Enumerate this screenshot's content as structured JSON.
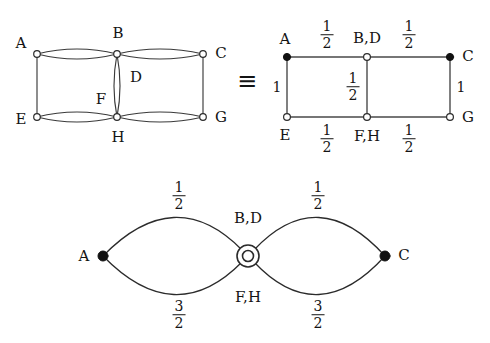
{
  "figure": {
    "equivalence_symbol": "≡",
    "background_color": "#ffffff",
    "stroke_color": "#3a3a3a",
    "text_color": "#141414"
  },
  "graph_left": {
    "name": "cube-like-multigraph",
    "vertices": [
      {
        "id": "A",
        "label": "A",
        "x": 37,
        "y": 54,
        "fill": "open"
      },
      {
        "id": "B",
        "label": "B",
        "x": 117,
        "y": 54,
        "fill": "open"
      },
      {
        "id": "C",
        "label": "C",
        "x": 203,
        "y": 54,
        "fill": "open"
      },
      {
        "id": "E",
        "label": "E",
        "x": 37,
        "y": 117,
        "fill": "open"
      },
      {
        "id": "H",
        "label": "H",
        "x": 117,
        "y": 117,
        "fill": "open"
      },
      {
        "id": "G",
        "label": "G",
        "x": 203,
        "y": 117,
        "fill": "open"
      }
    ],
    "interior_labels": [
      {
        "id": "D",
        "label": "D",
        "x": 136,
        "y": 77
      },
      {
        "id": "F",
        "label": "F",
        "x": 101,
        "y": 99
      }
    ],
    "vertex_label_offsets": {
      "A": {
        "x": 21,
        "y": 43
      },
      "B": {
        "x": 118,
        "y": 33
      },
      "C": {
        "x": 221,
        "y": 53
      },
      "E": {
        "x": 21,
        "y": 119
      },
      "G": {
        "x": 221,
        "y": 117
      },
      "H": {
        "x": 118,
        "y": 137
      }
    }
  },
  "graph_right": {
    "name": "quotient-grid-graph",
    "vertices": [
      {
        "id": "A",
        "label": "A",
        "x": 287,
        "y": 57,
        "fill": "filled"
      },
      {
        "id": "B,D",
        "label": "B,D",
        "x": 367,
        "y": 57,
        "fill": "open"
      },
      {
        "id": "C",
        "label": "C",
        "x": 450,
        "y": 57,
        "fill": "filled"
      },
      {
        "id": "E",
        "label": "E",
        "x": 287,
        "y": 117,
        "fill": "open"
      },
      {
        "id": "F,H",
        "label": "F,H",
        "x": 367,
        "y": 117,
        "fill": "open"
      },
      {
        "id": "G",
        "label": "G",
        "x": 450,
        "y": 117,
        "fill": "open"
      }
    ],
    "vertex_label_positions": {
      "A": {
        "x": 285,
        "y": 39
      },
      "B,D": {
        "x": 367,
        "y": 38
      },
      "C": {
        "x": 468,
        "y": 56
      },
      "E": {
        "x": 285,
        "y": 135
      },
      "F,H": {
        "x": 367,
        "y": 136
      },
      "G": {
        "x": 468,
        "y": 117
      }
    },
    "edge_weights": [
      {
        "from": "A",
        "to": "B,D",
        "numerator": "1",
        "denominator": "2",
        "x": 327,
        "y": 35
      },
      {
        "from": "B,D",
        "to": "C",
        "numerator": "1",
        "denominator": "2",
        "x": 409,
        "y": 35
      },
      {
        "from": "A",
        "to": "E",
        "whole": "1",
        "x": 277,
        "y": 87
      },
      {
        "from": "B,D",
        "to": "F,H",
        "numerator": "1",
        "denominator": "2",
        "x": 353,
        "y": 87
      },
      {
        "from": "C",
        "to": "G",
        "whole": "1",
        "x": 461,
        "y": 87
      },
      {
        "from": "E",
        "to": "F,H",
        "numerator": "1",
        "denominator": "2",
        "x": 327,
        "y": 139
      },
      {
        "from": "F,H",
        "to": "G",
        "numerator": "1",
        "denominator": "2",
        "x": 409,
        "y": 139
      }
    ]
  },
  "graph_bottom": {
    "name": "theta-lens-graph",
    "vertices": [
      {
        "id": "A",
        "label": "A",
        "x": 103,
        "y": 256,
        "fill": "filled"
      },
      {
        "id": "BDFH",
        "label": "",
        "x": 248,
        "y": 256,
        "fill": "double-circle"
      },
      {
        "id": "C",
        "label": "C",
        "x": 385,
        "y": 256,
        "fill": "filled"
      }
    ],
    "vertex_label_positions": {
      "A": {
        "x": 84,
        "y": 256
      },
      "C": {
        "x": 404,
        "y": 255
      }
    },
    "node_labels": [
      {
        "id": "B,D",
        "label": "B,D",
        "x": 248,
        "y": 218
      },
      {
        "id": "F,H",
        "label": "F,H",
        "x": 248,
        "y": 297
      }
    ],
    "edge_weights": [
      {
        "from": "A",
        "to": "BDFH",
        "position": "upper",
        "numerator": "1",
        "denominator": "2",
        "x": 179,
        "y": 196
      },
      {
        "from": "BDFH",
        "to": "C",
        "position": "upper",
        "numerator": "1",
        "denominator": "2",
        "x": 318,
        "y": 196
      },
      {
        "from": "A",
        "to": "BDFH",
        "position": "lower",
        "numerator": "3",
        "denominator": "2",
        "x": 179,
        "y": 315
      },
      {
        "from": "BDFH",
        "to": "C",
        "position": "lower",
        "numerator": "3",
        "denominator": "2",
        "x": 318,
        "y": 315
      }
    ]
  }
}
